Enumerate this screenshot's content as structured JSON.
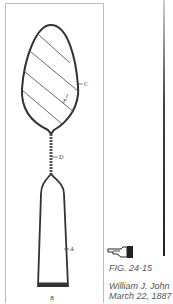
{
  "figure": {
    "caption": "FIG. 24-15",
    "inventor_line": "William J. John",
    "date_line": "March 22, 1887",
    "labels": {
      "c": "C",
      "f": "F",
      "d": "D",
      "a": "A",
      "b": "B"
    }
  },
  "icons": {
    "pointer": "pointing-hand-icon"
  },
  "colors": {
    "ink": "#333333",
    "border": "#bdbdbd",
    "caption_text": "#555555"
  }
}
